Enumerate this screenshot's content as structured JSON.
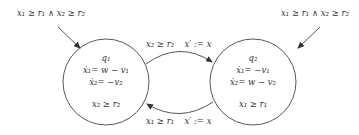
{
  "diagram": {
    "type": "hybrid-automaton",
    "colors": {
      "stroke": "#333333",
      "text": "#333333",
      "background": "#ffffff"
    },
    "initial_edges": [
      {
        "target": "q1",
        "guard": "x₁ ≥ r₁ ∧ x₂ ≥ r₂"
      },
      {
        "target": "q2",
        "guard": "x₁ ≥ r₁ ∧ x₂ ≥ r₂"
      }
    ],
    "states": [
      {
        "id": "q1",
        "name": "q₁",
        "flow": [
          "ẋ₁= w − v₁",
          "ẋ₂= −v₂"
        ],
        "invariant": "x₂ ≥ r₂"
      },
      {
        "id": "q2",
        "name": "q₂",
        "flow": [
          "ẋ₁= −v₁",
          "ẋ₂= w − v₂"
        ],
        "invariant": "x₁ ≥ r₁"
      }
    ],
    "transitions": [
      {
        "from": "q1",
        "to": "q2",
        "guard": "x₂ ≥ r₂",
        "reset": "x′ := x"
      },
      {
        "from": "q2",
        "to": "q1",
        "guard": "x₁ ≥ r₁",
        "reset": "x′ := x"
      }
    ]
  }
}
